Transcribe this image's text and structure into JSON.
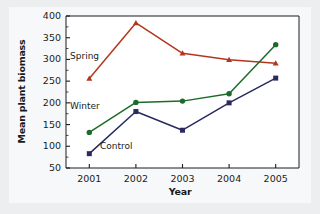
{
  "chart_data": {
    "type": "line",
    "title": "",
    "xlabel": "Year",
    "ylabel": "Mean plant biomass",
    "categories": [
      "2001",
      "2002",
      "2003",
      "2004",
      "2005"
    ],
    "ylim": [
      50,
      400
    ],
    "ytick_labels": [
      "50",
      "100",
      "150",
      "200",
      "250",
      "300",
      "350",
      "400"
    ],
    "ytick_values": [
      50,
      100,
      150,
      200,
      250,
      300,
      350,
      400
    ],
    "minor_ticks": true,
    "grid": false,
    "legend_position": "inline-labels",
    "series": [
      {
        "name": "Spring",
        "color": "#b5361f",
        "marker": "triangle",
        "values": [
          256,
          384,
          314,
          299,
          291
        ]
      },
      {
        "name": "Winter",
        "color": "#1d6b2a",
        "marker": "circle",
        "values": [
          132,
          201,
          204,
          221,
          334
        ]
      },
      {
        "name": "Control",
        "color": "#2a2a5e",
        "marker": "square",
        "values": [
          83,
          180,
          137,
          200,
          257
        ]
      }
    ]
  },
  "colors": {
    "page_background": "#c9cdd2",
    "figure_background": "#eceef0",
    "plot_background": "#ffffff",
    "axis": "#1b1d20",
    "spring": "#b5361f",
    "winter": "#1d6b2a",
    "control": "#2a2a5e"
  }
}
